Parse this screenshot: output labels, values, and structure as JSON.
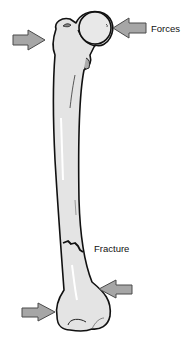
{
  "diagram": {
    "labels": {
      "forces": "Forces",
      "fracture": "Fracture"
    },
    "arrows": [
      {
        "name": "top-left-arrow",
        "direction": "right"
      },
      {
        "name": "top-right-arrow",
        "direction": "left"
      },
      {
        "name": "bottom-right-arrow",
        "direction": "left"
      },
      {
        "name": "bottom-left-arrow",
        "direction": "right"
      }
    ],
    "colors": {
      "bone_fill": "#e4e4e4",
      "bone_outline": "#111111",
      "arrow_fill": "#a6a6a6",
      "arrow_outline": "#4a4a4a",
      "background": "#ffffff"
    }
  }
}
